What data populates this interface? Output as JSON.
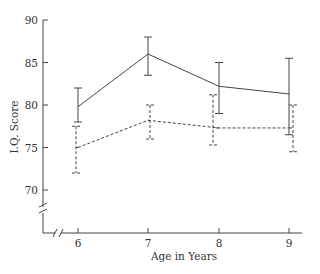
{
  "chart_data": {
    "type": "line",
    "title": "",
    "xlabel": "Age in Years",
    "ylabel": "I.Q. Score",
    "x": [
      6,
      7,
      8,
      9
    ],
    "x_tick_labels": [
      "6",
      "7",
      "8",
      "9"
    ],
    "y_ticks": [
      70,
      75,
      80,
      85,
      90
    ],
    "y_tick_labels": [
      "70",
      "75",
      "80",
      "85",
      "90"
    ],
    "ylim": [
      65,
      90
    ],
    "grid": false,
    "legend": null,
    "axis_breaks": {
      "x": true,
      "y": true
    },
    "series": [
      {
        "name": "solid",
        "line_style": "solid",
        "values": [
          79.8,
          86.0,
          82.2,
          81.3
        ],
        "error_low": [
          78.0,
          83.5,
          79.0,
          76.5
        ],
        "error_high": [
          82.0,
          88.0,
          85.0,
          85.5
        ]
      },
      {
        "name": "dashed",
        "line_style": "dashed",
        "values": [
          75.0,
          78.2,
          77.3,
          77.3
        ],
        "error_low": [
          72.0,
          76.0,
          75.3,
          74.5
        ],
        "error_high": [
          77.5,
          80.0,
          81.2,
          80.0
        ]
      }
    ]
  },
  "colors": {
    "line": "#444444",
    "axis": "#444444",
    "text": "#333333"
  }
}
